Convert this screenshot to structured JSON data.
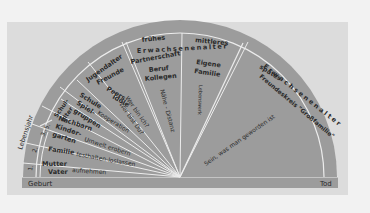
{
  "diagram": {
    "type": "semicircular life-stage wheel",
    "colors": {
      "background": "#f2f2f2",
      "panel": "#dcdcdc",
      "wheel_fill": "#9c9c9c",
      "divider_lines": "#ececec",
      "text": "#2a2a2a"
    },
    "baseline": {
      "start_label": "Geburt",
      "end_label": "Tod"
    },
    "axis_label": "Lebensjahr",
    "year_markers": [
      "1.",
      "2.",
      "3.-5."
    ],
    "stages": [
      {
        "outer": "Schulalter",
        "outer_lines": [
          "Schul-",
          "alter"
        ]
      },
      {
        "outer": "Jugendalter"
      },
      {
        "outer": "frühes Erwachsenenalter",
        "outer_lines": [
          "frühes",
          "Erwachsenenalter"
        ]
      },
      {
        "outer": "mittleres Erwachsenenalter",
        "outer_lines": [
          "mittleres",
          "Erwachsenenalter"
        ]
      },
      {
        "outer": "spätes Erwachsenenalter",
        "outer_lines": [
          "spätes",
          "Erwachsenenalter"
        ]
      }
    ],
    "wedges": [
      {
        "group": [
          "Mutter",
          "Vater"
        ],
        "task": "aufnehmen"
      },
      {
        "group": [
          "Familie"
        ],
        "task": "festhalten-loslassen"
      },
      {
        "group": [
          "Nachbarn",
          "Kinder-",
          "garten"
        ],
        "task": "Umwelt erobern"
      },
      {
        "group": [
          "Schule",
          "Spiel-",
          "gruppen"
        ],
        "task": "Kooperation"
      },
      {
        "group": [
          "Freunde",
          "Peers",
          "Idole"
        ],
        "task": [
          "Wer bin ich?",
          "Wer bist Du?"
        ]
      },
      {
        "group": [
          "Partnerschaft",
          "Beruf",
          "Kollegen"
        ],
        "task": "Nähe - Distanz"
      },
      {
        "group": [
          "Eigene",
          "Familie"
        ],
        "task": "Lebenswerk"
      },
      {
        "group": [
          "Freundeskreis \"Großfamilie\""
        ],
        "task": "Sein, was man geworden ist"
      }
    ]
  }
}
